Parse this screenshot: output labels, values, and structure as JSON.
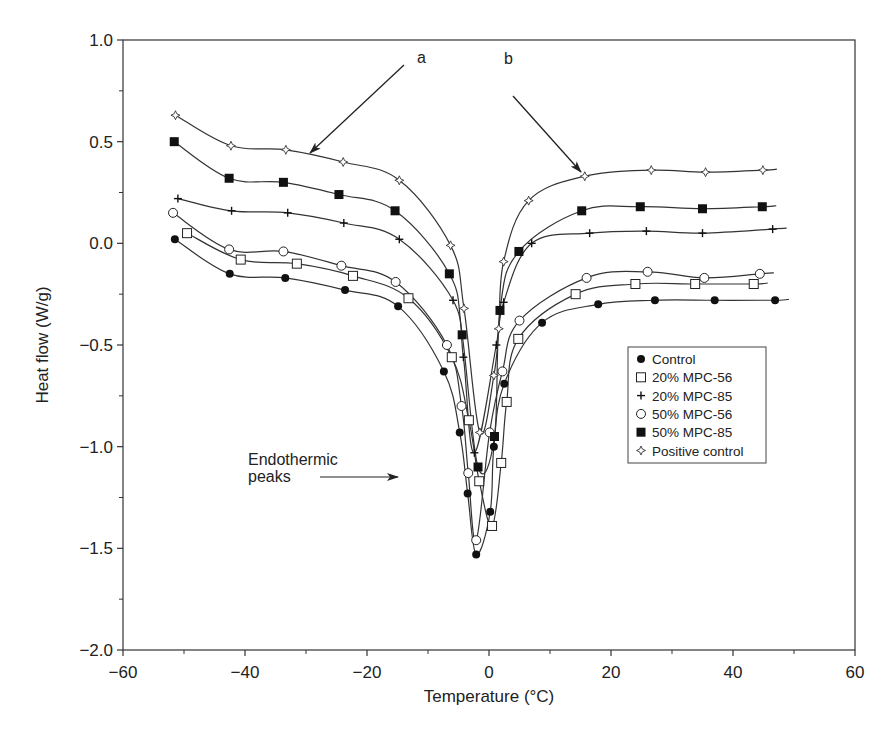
{
  "chart_data": {
    "type": "scatter",
    "title": "",
    "xlabel": "Temperature (°C)",
    "ylabel": "Heat flow (W/g)",
    "xlim": [
      -60,
      60
    ],
    "ylim": [
      -2.0,
      1.0
    ],
    "xticks": [
      -60,
      -40,
      -20,
      0,
      20,
      40,
      60
    ],
    "xtick_labels": [
      "−60",
      "−40",
      "−20",
      "0",
      "20",
      "40",
      "60"
    ],
    "yticks": [
      -2.0,
      -1.5,
      -1.0,
      -0.5,
      0.0,
      0.5,
      1.0
    ],
    "ytick_labels": [
      "−2.0",
      "−1.5",
      "−1.0",
      "−0.5",
      "0.0",
      "0.5",
      "1.0"
    ],
    "grid": false,
    "legend_position": "right-center",
    "series": [
      {
        "name": "Control",
        "marker": "filled-circle",
        "x": [
          -51.5,
          -42.5,
          -33.4,
          -23.6,
          -14.9,
          -7.4,
          -4.8,
          -3.5,
          -2.1,
          0.2,
          0.8,
          2.5,
          8.7,
          17.9,
          27.2,
          37.0,
          46.9
        ],
        "y": [
          0.02,
          -0.15,
          -0.17,
          -0.23,
          -0.31,
          -0.63,
          -0.93,
          -1.23,
          -1.53,
          -1.32,
          -1.0,
          -0.69,
          -0.39,
          -0.3,
          -0.28,
          -0.28,
          -0.28
        ]
      },
      {
        "name": "20% MPC-56",
        "marker": "open-square",
        "x": [
          -49.5,
          -40.7,
          -31.5,
          -22.3,
          -13.2,
          -6.1,
          -3.3,
          -1.6,
          0.5,
          2.0,
          2.9,
          4.8,
          14.2,
          24.0,
          33.8,
          43.4
        ],
        "y": [
          0.05,
          -0.08,
          -0.1,
          -0.16,
          -0.27,
          -0.56,
          -0.87,
          -1.17,
          -1.39,
          -1.08,
          -0.78,
          -0.47,
          -0.25,
          -0.2,
          -0.2,
          -0.2
        ]
      },
      {
        "name": "20% MPC-85",
        "marker": "plus",
        "x": [
          -51.0,
          -42.2,
          -33.0,
          -23.8,
          -14.7,
          -5.9,
          -4.2,
          -2.4,
          1.2,
          2.4,
          7.0,
          16.5,
          25.8,
          35.0,
          46.5
        ],
        "y": [
          0.22,
          0.16,
          0.15,
          0.1,
          0.02,
          -0.28,
          -0.56,
          -1.03,
          -0.5,
          -0.29,
          0.0,
          0.05,
          0.06,
          0.05,
          0.07
        ]
      },
      {
        "name": "50% MPC-56",
        "marker": "open-circle",
        "x": [
          -51.8,
          -42.6,
          -33.7,
          -24.2,
          -15.3,
          -6.9,
          -4.5,
          -3.4,
          -2.1,
          0.1,
          2.2,
          5.0,
          16.0,
          26.0,
          35.3,
          44.4
        ],
        "y": [
          0.15,
          -0.03,
          -0.04,
          -0.11,
          -0.19,
          -0.5,
          -0.8,
          -1.13,
          -1.46,
          -0.93,
          -0.63,
          -0.38,
          -0.17,
          -0.14,
          -0.17,
          -0.15
        ]
      },
      {
        "name": "50% MPC-85",
        "marker": "filled-square",
        "x": [
          -51.6,
          -42.6,
          -33.7,
          -24.6,
          -15.4,
          -6.5,
          -4.4,
          -1.8,
          0.9,
          1.8,
          4.9,
          15.2,
          24.8,
          35.0,
          44.8
        ],
        "y": [
          0.5,
          0.32,
          0.3,
          0.24,
          0.16,
          -0.15,
          -0.45,
          -1.1,
          -0.95,
          -0.33,
          -0.04,
          0.16,
          0.18,
          0.17,
          0.18
        ]
      },
      {
        "name": "Positive control",
        "marker": "open-diamond-star",
        "x": [
          -51.4,
          -42.3,
          -33.3,
          -23.9,
          -14.7,
          -6.3,
          -4.1,
          -1.5,
          0.8,
          1.6,
          2.4,
          6.5,
          15.7,
          26.6,
          35.5,
          44.9
        ],
        "y": [
          0.63,
          0.48,
          0.46,
          0.4,
          0.31,
          -0.01,
          -0.32,
          -0.93,
          -0.65,
          -0.42,
          -0.09,
          0.21,
          0.33,
          0.36,
          0.35,
          0.36
        ]
      }
    ],
    "annotations": [
      {
        "text": "a",
        "arrow_to": [
          -30,
          0.44
        ]
      },
      {
        "text": "b",
        "arrow_to": [
          15.5,
          0.35
        ]
      },
      {
        "text": "Endothermic peaks",
        "arrow_to": [
          -14,
          -1.28
        ]
      }
    ]
  },
  "labels": {
    "xlabel": "Temperature (°C)",
    "ylabel": "Heat flow (W/g)",
    "annot_a": "a",
    "annot_b": "b",
    "endo_line1": "Endothermic",
    "endo_line2": "peaks",
    "xticks": [
      "−60",
      "−40",
      "−20",
      "0",
      "20",
      "40",
      "60"
    ],
    "yticks": [
      "1.0",
      "0.5",
      "0.0",
      "−0.5",
      "−1.0",
      "−1.5",
      "−2.0"
    ]
  },
  "legend": [
    {
      "marker": "filled-circle",
      "label": "Control"
    },
    {
      "marker": "open-square",
      "label": "20% MPC-56"
    },
    {
      "marker": "plus",
      "label": "20% MPC-85"
    },
    {
      "marker": "open-circle",
      "label": "50% MPC-56"
    },
    {
      "marker": "filled-square",
      "label": "50% MPC-85"
    },
    {
      "marker": "open-diamond-star",
      "label": "Positive control"
    }
  ],
  "colors": {
    "ink": "#222222",
    "background": "#ffffff"
  }
}
